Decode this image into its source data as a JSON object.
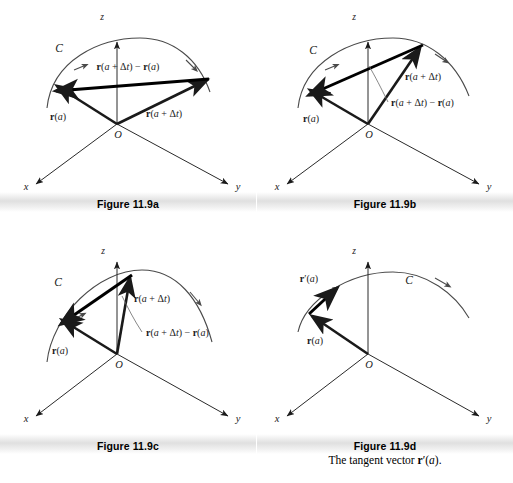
{
  "document": {
    "type": "textbook-figure-group",
    "figure_number": "11.9",
    "topic": "Derivative of a vector-valued function as limit of secant vectors"
  },
  "labels": {
    "axis_x": "x",
    "axis_y": "y",
    "axis_z": "z",
    "origin": "O",
    "curve": "C",
    "r_a": "r(a)",
    "r_a_dt": "r(a + Δt)",
    "secant": "r(a + Δt) − r(a)",
    "r_prime_a": "r′(a)"
  },
  "panels": [
    {
      "id": "a",
      "caption": "Figure 11.9a",
      "subcaption": "",
      "delta_t": "large",
      "visible_labels": [
        "C",
        "z",
        "x",
        "y",
        "O",
        "r(a)",
        "r(a + Δt)",
        "r(a + Δt) − r(a)"
      ],
      "description": "Position vectors r(a) and r(a + Δt) from origin to two widely separated points on curve C, with the secant difference vector drawn between their tips."
    },
    {
      "id": "b",
      "caption": "Figure 11.9b",
      "subcaption": "",
      "delta_t": "medium",
      "visible_labels": [
        "C",
        "z",
        "x",
        "y",
        "O",
        "r(a)",
        "r(a + Δt)",
        "r(a + Δt) − r(a)"
      ],
      "description": "The second point has moved closer along C; the secant vector is shorter and steeper, with a leader line to its label."
    },
    {
      "id": "c",
      "caption": "Figure 11.9c",
      "subcaption": "",
      "delta_t": "small",
      "visible_labels": [
        "C",
        "z",
        "x",
        "y",
        "O",
        "r(a)",
        "r(a + Δt)",
        "r(a + Δt) − r(a)"
      ],
      "description": "The two points are nearly coincident; the secant vector is short and approaches the tangent direction."
    },
    {
      "id": "d",
      "caption": "Figure 11.9d",
      "subcaption": "The tangent vector r′(a).",
      "delta_t": "limit",
      "visible_labels": [
        "C",
        "z",
        "x",
        "y",
        "O",
        "r(a)",
        "r′(a)"
      ],
      "description": "Limiting case: only r(a) and the tangent vector r′(a) drawn at the point, pointing along C."
    }
  ],
  "style": {
    "ink": "#1a1a1a",
    "thin_line": "#3a3a3a",
    "curve_color": "#4a4a4a",
    "caption_band": "#c6c6c6",
    "background": "#ffffff"
  }
}
